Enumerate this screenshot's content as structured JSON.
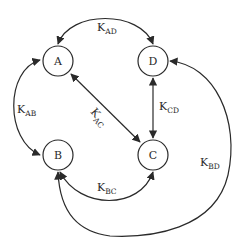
{
  "diagram": {
    "type": "state-transition",
    "nodes": [
      {
        "id": "A",
        "label": "A"
      },
      {
        "id": "B",
        "label": "B"
      },
      {
        "id": "C",
        "label": "C"
      },
      {
        "id": "D",
        "label": "D"
      }
    ],
    "edges": [
      {
        "from": "A",
        "to": "D",
        "label_main": "K",
        "label_sub": "AD",
        "bidirectional": true
      },
      {
        "from": "A",
        "to": "B",
        "label_main": "K",
        "label_sub": "AB",
        "bidirectional": true
      },
      {
        "from": "A",
        "to": "C",
        "label_main": "K",
        "label_sub": "AC",
        "bidirectional": true
      },
      {
        "from": "C",
        "to": "D",
        "label_main": "K",
        "label_sub": "CD",
        "bidirectional": true
      },
      {
        "from": "B",
        "to": "C",
        "label_main": "K",
        "label_sub": "BC",
        "bidirectional": true
      },
      {
        "from": "B",
        "to": "D",
        "label_main": "K",
        "label_sub": "BD",
        "bidirectional": true
      }
    ]
  }
}
